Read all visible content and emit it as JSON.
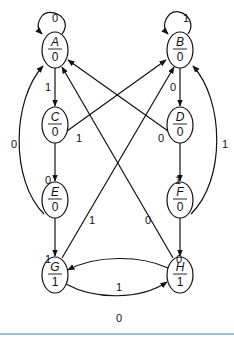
{
  "diagram": {
    "type": "moore-state-machine",
    "states": [
      {
        "id": "A",
        "name": "A",
        "output": "0"
      },
      {
        "id": "B",
        "name": "B",
        "output": "0"
      },
      {
        "id": "C",
        "name": "C",
        "output": "0"
      },
      {
        "id": "D",
        "name": "D",
        "output": "0"
      },
      {
        "id": "E",
        "name": "E",
        "output": "0"
      },
      {
        "id": "F",
        "name": "F",
        "output": "0"
      },
      {
        "id": "G",
        "name": "G",
        "output": "1"
      },
      {
        "id": "H",
        "name": "H",
        "output": "1"
      }
    ],
    "transitions": [
      {
        "from": "A",
        "to": "A",
        "input": "0"
      },
      {
        "from": "A",
        "to": "C",
        "input": "1"
      },
      {
        "from": "B",
        "to": "B",
        "input": "1"
      },
      {
        "from": "B",
        "to": "D",
        "input": "0"
      },
      {
        "from": "C",
        "to": "E",
        "input": "0"
      },
      {
        "from": "C",
        "to": "B",
        "input": "1"
      },
      {
        "from": "D",
        "to": "F",
        "input": "1"
      },
      {
        "from": "D",
        "to": "A",
        "input": "0"
      },
      {
        "from": "E",
        "to": "G",
        "input": "1"
      },
      {
        "from": "E",
        "to": "A",
        "input": "0"
      },
      {
        "from": "F",
        "to": "H",
        "input": "0"
      },
      {
        "from": "F",
        "to": "B",
        "input": "1"
      },
      {
        "from": "G",
        "to": "H",
        "input": "0"
      },
      {
        "from": "G",
        "to": "B",
        "input": "1"
      },
      {
        "from": "H",
        "to": "G",
        "input": "1"
      },
      {
        "from": "H",
        "to": "A",
        "input": "0"
      }
    ]
  },
  "colors": {
    "stroke": "#111111",
    "bottom_rule": "#8ec9d3"
  }
}
